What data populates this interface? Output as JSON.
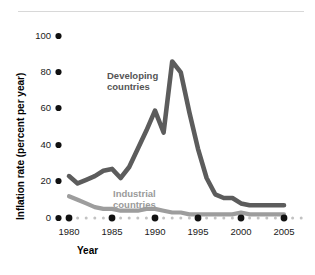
{
  "chart_data": {
    "type": "line",
    "title": "",
    "xlabel": "Year",
    "ylabel": "Inflation rate (percent per year)",
    "xlim": [
      1979,
      2006
    ],
    "ylim": [
      0,
      104
    ],
    "xticks": [
      1980,
      1985,
      1990,
      1995,
      2000,
      2005
    ],
    "xtick_labels": [
      "1980",
      "1985",
      "1990",
      "1995",
      "2000",
      "2005"
    ],
    "yticks": [
      0,
      20,
      40,
      60,
      80,
      100
    ],
    "ytick_labels": [
      "0",
      "20",
      "40",
      "60",
      "80",
      "100"
    ],
    "grid": false,
    "legend_position": "inline-annotation",
    "series": [
      {
        "name": "Developing countries",
        "color": "#5c5c5c",
        "label_line1": "Developing",
        "label_line2": "countries",
        "x": [
          1980,
          1981,
          1982,
          1983,
          1984,
          1985,
          1986,
          1987,
          1988,
          1989,
          1990,
          1991,
          1992,
          1993,
          1994,
          1995,
          1996,
          1997,
          1998,
          1999,
          2000,
          2001,
          2002,
          2003,
          2004,
          2005
        ],
        "values": [
          23,
          19,
          21,
          23,
          26,
          27,
          22,
          28,
          38,
          48,
          59,
          47,
          86,
          80,
          58,
          38,
          22,
          13,
          11,
          11,
          8,
          7,
          7,
          7,
          7,
          7
        ]
      },
      {
        "name": "Industrial countries",
        "color": "#9d9d9d",
        "label_line1": "Industrial",
        "label_line2": "countries",
        "x": [
          1980,
          1981,
          1982,
          1983,
          1984,
          1985,
          1986,
          1987,
          1988,
          1989,
          1990,
          1991,
          1992,
          1993,
          1994,
          1995,
          1996,
          1997,
          1998,
          1999,
          2000,
          2001,
          2002,
          2003,
          2004,
          2005
        ],
        "values": [
          12,
          10,
          8,
          6,
          5,
          5,
          4,
          4,
          4,
          5,
          5,
          4,
          3,
          3,
          2,
          2,
          2,
          2,
          2,
          2,
          3,
          2,
          2,
          2,
          2,
          2
        ]
      }
    ],
    "annotations": [
      {
        "text": "Developing countries",
        "x": 1988,
        "y": 72
      },
      {
        "text": "Industrial countries",
        "x": 1987,
        "y": 20
      }
    ]
  }
}
